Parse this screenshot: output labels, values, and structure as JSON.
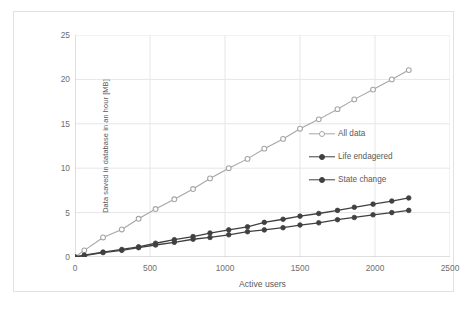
{
  "chart_data": {
    "type": "line",
    "title": "",
    "xlabel": "Active users",
    "ylabel": "Data saved in database in an hour [MB]",
    "xlim": [
      0,
      2500
    ],
    "ylim": [
      0,
      25
    ],
    "xticks": [
      "0",
      "500",
      "1000",
      "1500",
      "2000",
      "2500"
    ],
    "xtick_values": [
      0,
      500,
      1000,
      1500,
      2000,
      2500
    ],
    "yticks": [
      "0",
      "5",
      "10",
      "15",
      "20",
      "25"
    ],
    "ytick_values": [
      0,
      5,
      10,
      15,
      20,
      25
    ],
    "grid": true,
    "legend_position": "center-right (inside plot area)",
    "x": [
      0,
      62,
      187,
      312,
      424,
      537,
      662,
      787,
      900,
      1025,
      1150,
      1262,
      1387,
      1500,
      1625,
      1750,
      1862,
      1987,
      2112,
      2225
    ],
    "series": [
      {
        "name": "All data",
        "color": "#a6a6a6",
        "marker": "open-circle",
        "values": [
          0.0,
          0.75,
          2.2,
          3.1,
          4.3,
          5.4,
          6.5,
          7.65,
          8.85,
          10.0,
          11.05,
          12.2,
          13.3,
          14.45,
          15.5,
          16.65,
          17.75,
          18.85,
          20.0,
          21.05
        ]
      },
      {
        "name": "Life endagered",
        "color": "#404040",
        "marker": "filled-circle",
        "values": [
          0.0,
          0.2,
          0.55,
          0.85,
          1.15,
          1.55,
          1.95,
          2.3,
          2.7,
          3.05,
          3.4,
          3.9,
          4.25,
          4.6,
          4.9,
          5.25,
          5.6,
          5.95,
          6.3,
          6.65
        ]
      },
      {
        "name": "State change",
        "color": "#404040",
        "marker": "filled-circle",
        "values": [
          0.0,
          0.15,
          0.5,
          0.75,
          1.05,
          1.35,
          1.65,
          2.0,
          2.2,
          2.5,
          2.85,
          3.05,
          3.3,
          3.6,
          3.85,
          4.2,
          4.45,
          4.75,
          5.0,
          5.25
        ]
      }
    ]
  },
  "axes": {
    "y_title": "Data saved in database in an hour [MB]",
    "x_title": "Active users"
  },
  "legend": {
    "items": [
      {
        "label": "All data"
      },
      {
        "label": "Life endagered"
      },
      {
        "label": "State change"
      }
    ]
  },
  "colors": {
    "series_light": "#a6a6a6",
    "series_dark": "#3f3f3f",
    "grid": "#e6e6e6",
    "axis": "#bfbfbf",
    "text": "#6e6e6e",
    "frame": "#e2e2e2"
  }
}
